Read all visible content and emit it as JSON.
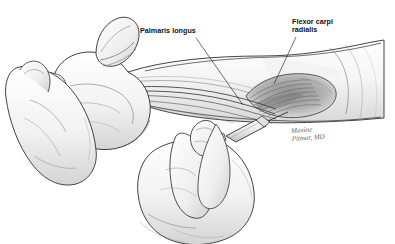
{
  "figure": {
    "kind": "anatomical-pencil-illustration",
    "background_color": "#ffffff",
    "ink_color": "#2b2b2b",
    "shading_color": "#9a9a9a",
    "width": 395,
    "height": 244
  },
  "annotations": [
    {
      "id": "palmaris-longus",
      "text": "Palmaris longus",
      "lines": [
        "Palmaris longus"
      ],
      "label_x": 140,
      "label_y": 27,
      "leader_from_x": 196,
      "leader_from_y": 38,
      "leader_to_x": 243,
      "leader_to_y": 105
    },
    {
      "id": "flexor-carpi-radialis",
      "text": "Flexor carpi radialis",
      "lines": [
        "Flexor carpi",
        "radialis"
      ],
      "label_x": 292,
      "label_y": 18,
      "leader_from_x": 296,
      "leader_from_y": 37,
      "leader_to_x": 274,
      "leader_to_y": 84
    }
  ],
  "signature": {
    "lines": [
      "Maxine",
      "Pitmar, MD"
    ],
    "text": "Maxine\nPitmar, MD",
    "x": 291,
    "y": 128
  },
  "anatomy": {
    "structures": [
      "patient forearm",
      "clenched fist",
      "thumb",
      "wrist flexor tendons",
      "flexor carpi radialis muscle belly",
      "palmaris longus tendon",
      "examiner supporting hand",
      "examiner injecting hand",
      "syringe",
      "needle"
    ]
  }
}
